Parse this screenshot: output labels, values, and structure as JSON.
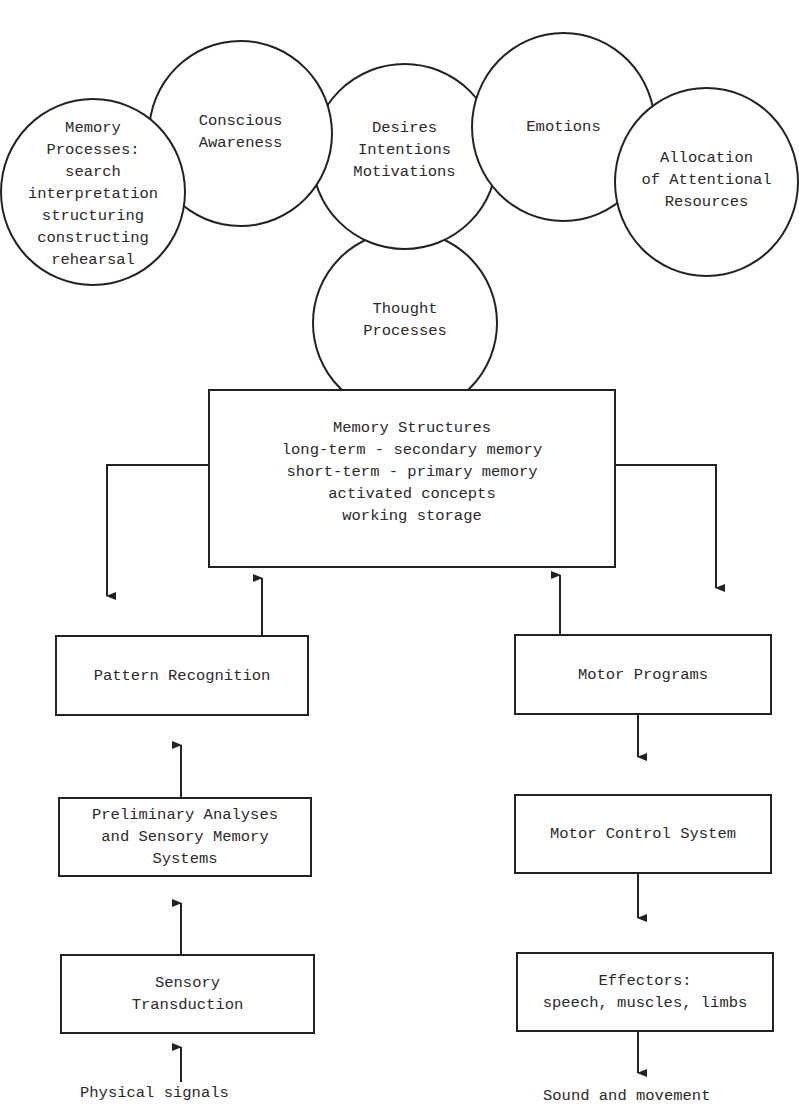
{
  "circles": {
    "memory_processes": {
      "lines": [
        "Memory",
        "Processes:",
        "search",
        "interpretation",
        "structuring",
        "constructing",
        "rehearsal"
      ]
    },
    "conscious_awareness": {
      "lines": [
        "Conscious",
        "Awareness"
      ]
    },
    "desires": {
      "lines": [
        "Desires",
        "Intentions",
        "Motivations"
      ]
    },
    "emotions": {
      "lines": [
        "Emotions"
      ]
    },
    "allocation": {
      "lines": [
        "Allocation",
        "of Attentional",
        "Resources"
      ]
    },
    "thought_processes": {
      "lines": [
        "Thought",
        "Processes"
      ]
    }
  },
  "boxes": {
    "memory_structures": {
      "lines": [
        "Memory Structures",
        "long-term - secondary memory",
        "short-term - primary memory",
        "activated concepts",
        "working storage"
      ]
    },
    "pattern_recognition": {
      "lines": [
        "Pattern Recognition"
      ]
    },
    "preliminary_analyses": {
      "lines": [
        "Preliminary Analyses",
        "and Sensory Memory",
        "Systems"
      ]
    },
    "sensory_transduction": {
      "lines": [
        "Sensory",
        "Transduction"
      ]
    },
    "motor_programs": {
      "lines": [
        "Motor Programs"
      ]
    },
    "motor_control": {
      "lines": [
        "Motor Control System"
      ]
    },
    "effectors": {
      "lines": [
        "Effectors:",
        "speech, muscles, limbs"
      ]
    }
  },
  "captions": {
    "input": "Physical signals",
    "output": "Sound and movement"
  },
  "colors": {
    "line": "#222222",
    "text": "#2a2a2a",
    "background": "#ffffff"
  }
}
